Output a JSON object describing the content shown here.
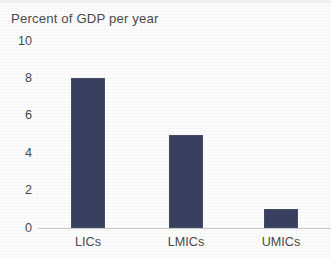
{
  "chart_data": {
    "type": "bar",
    "title": "Percent of GDP per year",
    "subtitle": "",
    "xlabel": "",
    "ylabel": "",
    "categories": [
      "LICs",
      "LMICs",
      "UMICs"
    ],
    "values": [
      8,
      5,
      1
    ],
    "series": [
      {
        "name": "Percent of GDP per year",
        "values": [
          8,
          5,
          1
        ]
      }
    ],
    "ylim": [
      0,
      10
    ],
    "yticks": [
      "0",
      "2",
      "4",
      "6",
      "8",
      "10"
    ],
    "ytick_values": [
      0,
      2,
      4,
      6,
      8,
      10
    ],
    "grid": false,
    "legend": "none",
    "bar_color": "#3a4160",
    "axis_color": "#c8c8c8",
    "text_color": "#4a4a4a",
    "background": "#fdfdfd"
  }
}
